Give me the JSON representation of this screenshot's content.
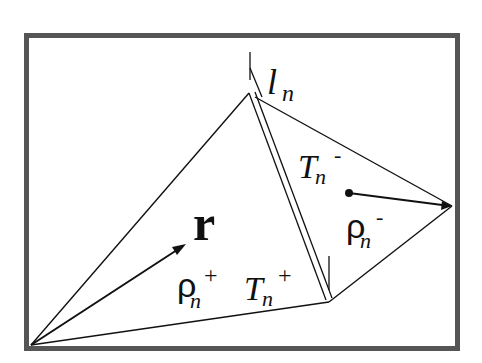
{
  "diagram": {
    "type": "RWG basis function (two adjacent triangles sharing an edge)",
    "colors": {
      "frame": "#555555",
      "lines": "#111111",
      "background": "#ffffff"
    },
    "labels": {
      "edge_main": "l",
      "edge_sub": "n",
      "r_vector": "r",
      "t_minus_main": "T",
      "t_minus_sub": "n",
      "t_minus_sup": "-",
      "rho_minus_main": "ρ",
      "rho_minus_sub": "n",
      "rho_minus_sup": "-",
      "rho_plus_main": "ρ",
      "rho_plus_sub": "n",
      "rho_plus_sup": "+",
      "t_plus_main": "T",
      "t_plus_sub": "n",
      "t_plus_sup": "+"
    },
    "vertices": {
      "free_vertex_plus": [
        31,
        345
      ],
      "edge_top": [
        249,
        93
      ],
      "edge_bottom": [
        329,
        302
      ],
      "free_vertex_minus": [
        452,
        206
      ],
      "centroid_minus": [
        349,
        193
      ]
    }
  }
}
